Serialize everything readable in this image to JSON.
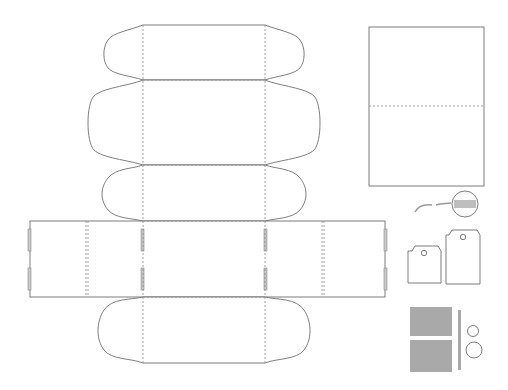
{
  "colors": {
    "cut_line": "#6e6e6e",
    "fold_line": "#8a8a8a",
    "paper": "#ffffff",
    "grey_panel": "#a9a9a9"
  },
  "legend": {
    "cut_line": "solid line = cut",
    "fold_line": "dashed line = fold"
  },
  "pieces": [
    {
      "name": "box-net",
      "parts": [
        "lid-flap",
        "lid-top",
        "front-panel",
        "base",
        "back-panel",
        "left-side",
        "right-side",
        "bottom-flap"
      ]
    },
    {
      "name": "folded-card",
      "fold": "horizontal-center"
    },
    {
      "name": "string-with-seal"
    },
    {
      "name": "small-tag",
      "hole": true
    },
    {
      "name": "large-tag",
      "hole": true
    },
    {
      "name": "grey-band-panel"
    },
    {
      "name": "grey-strip"
    },
    {
      "name": "small-circle"
    },
    {
      "name": "large-circle"
    }
  ]
}
